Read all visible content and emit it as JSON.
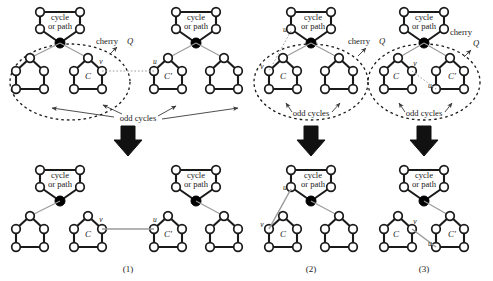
{
  "figure": {
    "colors": {
      "node_fill": "#ffffff",
      "node_stroke": "#1a1a1a",
      "cherry_fill": "#000000",
      "thick_edge": "#1a1a1a",
      "thin_edge": "#9a9a9a",
      "dashed_ellipse": "#1a1a1a",
      "arrow_fill": "#111111",
      "background": "#ffffff"
    }
  },
  "labels": {
    "cycle_or_path_line1": "cycle",
    "cycle_or_path_line2": "or path",
    "cherry": "cherry",
    "cherry_symbol": "Q",
    "odd_cycles": "odd cycles",
    "C": "C",
    "Cprime": "C'",
    "u": "u",
    "v": "v"
  },
  "panels": [
    {
      "id": "panel-1",
      "caption": "(1)",
      "top": {
        "cycle_or_path_count": 2,
        "cherry_count": 2,
        "odd_cycle_count": 4,
        "named_cycles": [
          "C",
          "C'"
        ],
        "endpoint_labels": [
          "v",
          "u"
        ],
        "has_cherry_label": true,
        "has_odd_cycles_label": true,
        "dashed_ellipse": true
      },
      "bottom": {
        "cycle_or_path_count": 2,
        "cherry_count": 2,
        "odd_cycle_count": 4,
        "named_cycles": [
          "C",
          "C'"
        ],
        "endpoint_labels": [
          "v",
          "u"
        ],
        "new_edge": "v-u"
      }
    },
    {
      "id": "panel-2",
      "caption": "(2)",
      "top": {
        "cycle_or_path_count": 1,
        "cherry_count": 1,
        "odd_cycle_count": 2,
        "named_cycles": [
          "C"
        ],
        "endpoint_labels": [
          "u",
          "v"
        ],
        "has_cherry_label": true,
        "has_odd_cycles_label": true,
        "dashed_ellipse": true
      },
      "bottom": {
        "cycle_or_path_count": 1,
        "cherry_count": 1,
        "odd_cycle_count": 2,
        "named_cycles": [
          "C"
        ],
        "endpoint_labels": [
          "u",
          "v"
        ],
        "new_edge": "u-v"
      }
    },
    {
      "id": "panel-3",
      "caption": "(3)",
      "top": {
        "cycle_or_path_count": 1,
        "cherry_count": 1,
        "odd_cycle_count": 2,
        "named_cycles": [
          "C",
          "C'"
        ],
        "endpoint_labels": [
          "v",
          "u"
        ],
        "has_cherry_label": true,
        "has_odd_cycles_label": true,
        "dashed_ellipse": true
      },
      "bottom": {
        "cycle_or_path_count": 1,
        "cherry_count": 1,
        "odd_cycle_count": 2,
        "named_cycles": [
          "C",
          "C'"
        ],
        "endpoint_labels": [
          "v",
          "u"
        ],
        "new_edge": "v-u"
      }
    }
  ],
  "arrows": {
    "count": 3,
    "direction": "down"
  }
}
